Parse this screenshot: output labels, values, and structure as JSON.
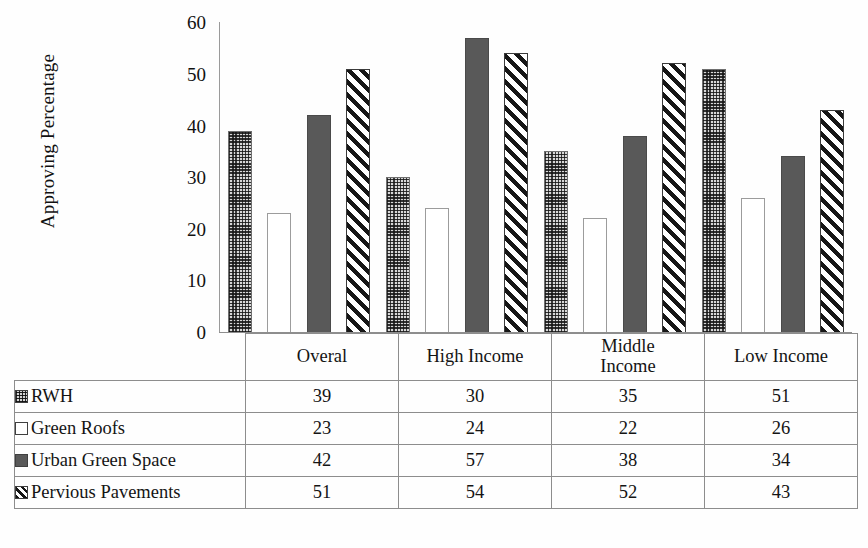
{
  "chart_data": {
    "type": "bar",
    "title": "",
    "xlabel": "",
    "ylabel": "Approving Percentage",
    "ylim": [
      0,
      60
    ],
    "ytick_step": 10,
    "yticks": [
      60,
      50,
      40,
      30,
      20,
      10,
      0
    ],
    "grid": false,
    "legend_position": "table-below",
    "categories": [
      "Overal",
      "High Income",
      "Middle Income",
      "Low Income"
    ],
    "series": [
      {
        "name": "RWH",
        "values": [
          39,
          30,
          35,
          51
        ],
        "pattern": "dotted-stipple"
      },
      {
        "name": "Green Roofs",
        "values": [
          23,
          24,
          22,
          26
        ],
        "pattern": "white-outline"
      },
      {
        "name": "Urban Green Space",
        "values": [
          42,
          57,
          38,
          34
        ],
        "pattern": "solid-dark-gray"
      },
      {
        "name": "Pervious Pavements",
        "values": [
          51,
          54,
          52,
          43
        ],
        "pattern": "diagonal-hatch"
      }
    ]
  },
  "table": {
    "corner_label": "",
    "column_headers": [
      "Overal",
      "High Income",
      "Middle\nIncome",
      "Low Income"
    ],
    "column_headers_display": {
      "c0": "Overal",
      "c1": "High Income",
      "c2_line1": "Middle",
      "c2_line2": "Income",
      "c3": "Low Income"
    },
    "rows": [
      {
        "label": "RWH",
        "swatch": "dotted-stipple-swatch",
        "values": [
          "39",
          "30",
          "35",
          "51"
        ]
      },
      {
        "label": "Green Roofs",
        "swatch": "white-outline-swatch",
        "values": [
          "23",
          "24",
          "22",
          "26"
        ]
      },
      {
        "label": "Urban Green Space",
        "swatch": "solid-gray-swatch",
        "values": [
          "42",
          "57",
          "38",
          "34"
        ]
      },
      {
        "label": "Pervious Pavements",
        "swatch": "diagonal-hatch-swatch",
        "values": [
          "51",
          "54",
          "52",
          "43"
        ]
      }
    ]
  },
  "axis": {
    "y_title": "Approving Percentage",
    "ticks": [
      "60",
      "50",
      "40",
      "30",
      "20",
      "10",
      "0"
    ]
  },
  "colors": {
    "solid_bar": "#595959",
    "stipple_base": "#d8d8d8",
    "hatch_dark": "#161616",
    "axis_line": "#9a9a9a",
    "table_border": "#8d8d8d",
    "background": "#fefefe"
  },
  "caption": {
    "fragment": ""
  }
}
